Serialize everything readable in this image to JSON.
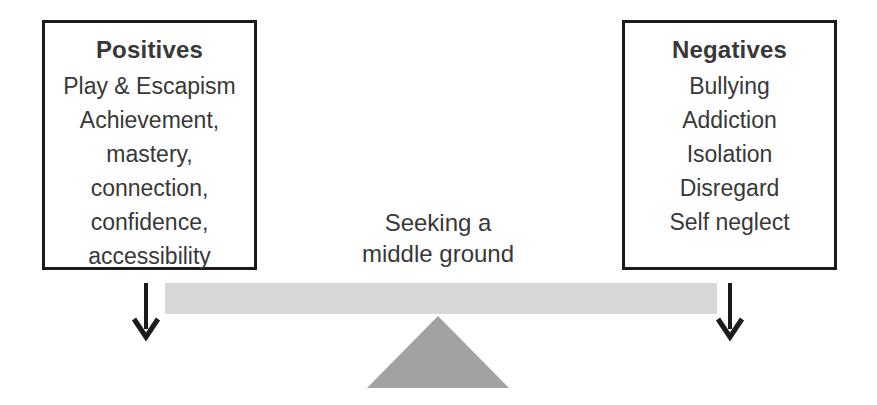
{
  "positives": {
    "title": "Positives",
    "items": [
      "Play & Escapism",
      "Achievement,",
      "mastery,",
      "connection,",
      "confidence,",
      "accessibility"
    ]
  },
  "negatives": {
    "title": "Negatives",
    "items": [
      "Bullying",
      "Addiction",
      "Isolation",
      "Disregard",
      "Self neglect"
    ]
  },
  "center_label": {
    "line1": "Seeking a",
    "line2": "middle ground"
  },
  "icons": {
    "left_arrow": "down-arrow-icon",
    "right_arrow": "down-arrow-icon"
  },
  "colors": {
    "background": "#ffffff",
    "box_border": "#1b1b1b",
    "text": "#383838",
    "beam": "#d8d8d8",
    "fulcrum": "#a2a2a2",
    "arrow": "#1b1b1b"
  }
}
